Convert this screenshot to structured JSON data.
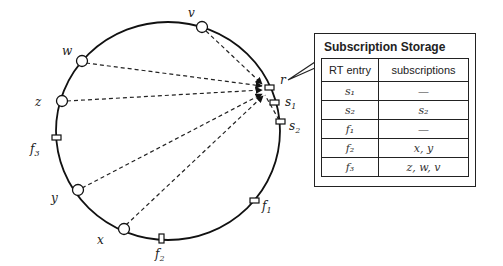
{
  "storage": {
    "title": "Subscription Storage",
    "headers": {
      "entry": "RT entry",
      "subscriptions": "subscriptions"
    },
    "rows": [
      {
        "entry": "s₁",
        "subscriptions": "—"
      },
      {
        "entry": "s₂",
        "subscriptions": "s₂"
      },
      {
        "entry": "f₁",
        "subscriptions": "—"
      },
      {
        "entry": "f₂",
        "subscriptions": "x, y"
      },
      {
        "entry": "f₃",
        "subscriptions": "z, w, v"
      }
    ]
  },
  "ring": {
    "nodes": {
      "v": "v",
      "w": "w",
      "z": "z",
      "y": "y",
      "x": "x"
    },
    "entries": {
      "r": "r",
      "s1": "s",
      "s1_sub": "1",
      "s2": "s",
      "s2_sub": "2",
      "f1": "f",
      "f1_sub": "1",
      "f2": "f",
      "f2_sub": "2",
      "f3": "f",
      "f3_sub": "3"
    }
  }
}
